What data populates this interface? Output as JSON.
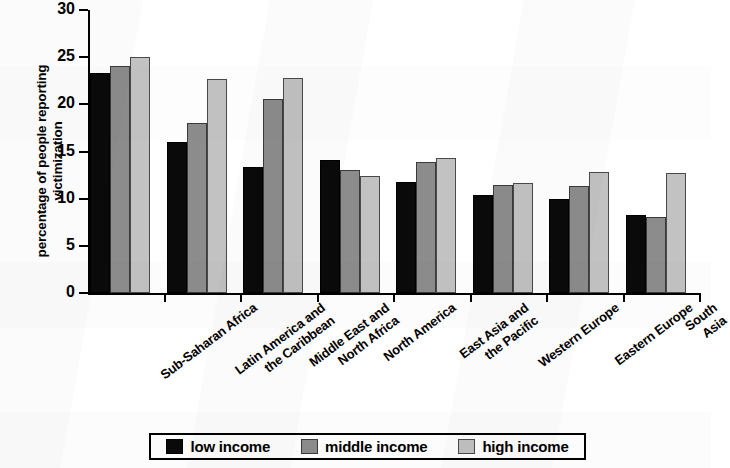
{
  "chart_data": {
    "type": "bar",
    "title": "",
    "xlabel": "",
    "ylabel": "percentage of people reporting victimization",
    "ylabel_line1": "percentage of people reporting",
    "ylabel_line2": "victimization",
    "ylim": [
      0,
      30
    ],
    "ytick_step": 5,
    "ytick_labels": [
      "0",
      "5",
      "10",
      "15",
      "20",
      "25",
      "30"
    ],
    "ytick_values": [
      0,
      5,
      10,
      15,
      20,
      25,
      30
    ],
    "grid": false,
    "legend_position": "bottom",
    "categories": [
      "Sub-Saharan Africa",
      "Latin America and\nthe Caribbean",
      "Middle East and\nNorth Africa",
      "North America",
      "East Asia and\nthe Pacific",
      "Western Europe",
      "Eastern Europe",
      "South Asia"
    ],
    "series": [
      {
        "name": "low income",
        "color": "#0a0a0a",
        "values": [
          23.3,
          16.0,
          13.4,
          14.1,
          11.8,
          10.4,
          10.0,
          8.3
        ]
      },
      {
        "name": "middle income",
        "color": "#8c8c8c",
        "values": [
          24.1,
          18.0,
          20.6,
          13.0,
          13.9,
          11.4,
          11.3,
          8.1
        ]
      },
      {
        "name": "high income",
        "color": "#c2c2c2",
        "values": [
          25.0,
          22.7,
          22.8,
          12.4,
          14.3,
          11.7,
          12.8,
          12.7
        ]
      }
    ]
  }
}
